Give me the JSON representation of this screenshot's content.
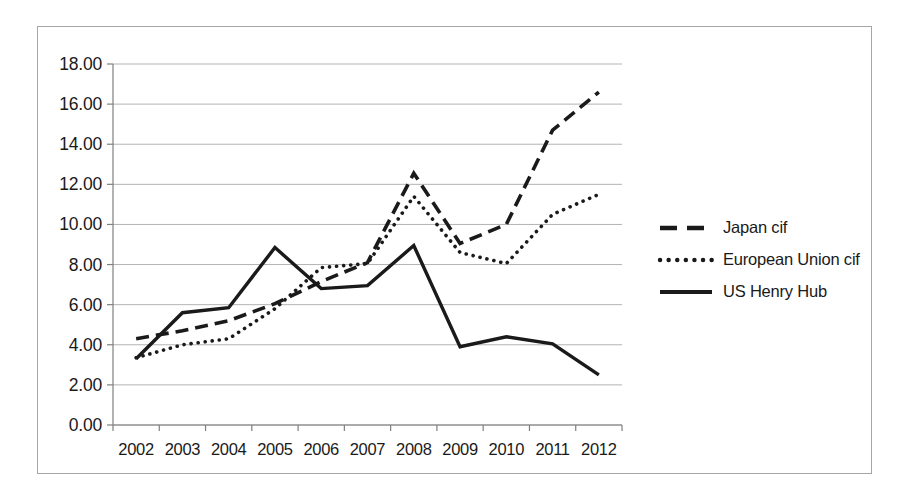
{
  "chart_data": {
    "type": "line",
    "title": "",
    "subtitle": "",
    "xlabel": "",
    "ylabel": "",
    "categories": [
      "2002",
      "2003",
      "2004",
      "2005",
      "2006",
      "2007",
      "2008",
      "2009",
      "2010",
      "2011",
      "2012"
    ],
    "ylim": [
      0.0,
      18.0
    ],
    "ytick_values": [
      0.0,
      2.0,
      4.0,
      6.0,
      8.0,
      10.0,
      12.0,
      14.0,
      16.0,
      18.0
    ],
    "ytick_labels": [
      "0.00",
      "2.00",
      "4.00",
      "6.00",
      "8.00",
      "10.00",
      "12.00",
      "14.00",
      "16.00",
      "18.00"
    ],
    "grid": true,
    "grid_axis": "y",
    "legend_position": "right",
    "series": [
      {
        "name": "Japan cif",
        "style": "dashed",
        "color": "#1a1a1a",
        "values": [
          4.3,
          4.7,
          5.2,
          6.05,
          7.15,
          8.1,
          12.55,
          9.05,
          10.0,
          14.7,
          16.6
        ]
      },
      {
        "name": "European Union cif",
        "style": "dotted",
        "color": "#1a1a1a",
        "values": [
          3.35,
          4.0,
          4.3,
          5.8,
          7.85,
          8.05,
          11.4,
          8.6,
          8.05,
          10.5,
          11.5
        ]
      },
      {
        "name": "US Henry Hub",
        "style": "solid",
        "color": "#1a1a1a",
        "values": [
          3.3,
          5.6,
          5.85,
          8.85,
          6.8,
          6.95,
          8.95,
          3.9,
          4.4,
          4.05,
          2.5
        ]
      }
    ]
  },
  "axes": {
    "gridline_color": "#b3b3b3",
    "axis_color": "#7f7f7f",
    "frame_color": "#a6a6a6"
  },
  "legend": {
    "entries": [
      {
        "label": "Japan cif",
        "style": "dashed"
      },
      {
        "label": "European Union cif",
        "style": "dotted"
      },
      {
        "label": "US Henry Hub",
        "style": "solid"
      }
    ]
  }
}
